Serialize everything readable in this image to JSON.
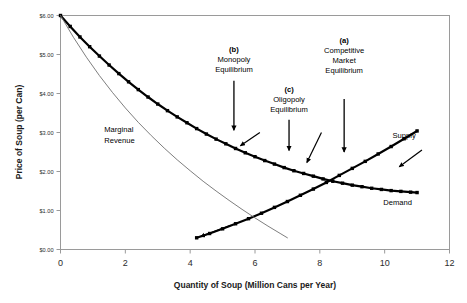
{
  "chart_data": {
    "type": "line",
    "title": "",
    "xlabel": "Quantity of Soup (Million Cans per Year)",
    "ylabel": "Price of Soup (per Can)",
    "xlim": [
      0,
      12
    ],
    "ylim": [
      0,
      6
    ],
    "xticks": [
      "0",
      "2",
      "4",
      "6",
      "8",
      "10",
      "12"
    ],
    "yticks": [
      "$0.00",
      "$1.00",
      "$2.00",
      "$3.00",
      "$4.00",
      "$5.00",
      "$6.00"
    ],
    "grid": false,
    "legend": "inline-labels",
    "series": [
      {
        "name": "Demand",
        "style": "thick-dotted-black",
        "label": "Demand",
        "label_x": 10.4,
        "label_y": 1.15,
        "points": [
          [
            0.0,
            6.0
          ],
          [
            0.3,
            5.72
          ],
          [
            0.6,
            5.45
          ],
          [
            0.9,
            5.2
          ],
          [
            1.2,
            4.96
          ],
          [
            1.5,
            4.73
          ],
          [
            1.8,
            4.51
          ],
          [
            2.1,
            4.3
          ],
          [
            2.4,
            4.1
          ],
          [
            2.7,
            3.91
          ],
          [
            3.0,
            3.73
          ],
          [
            3.3,
            3.56
          ],
          [
            3.6,
            3.4
          ],
          [
            3.9,
            3.25
          ],
          [
            4.2,
            3.1
          ],
          [
            4.5,
            2.96
          ],
          [
            4.8,
            2.83
          ],
          [
            5.1,
            2.71
          ],
          [
            5.4,
            2.59
          ],
          [
            5.7,
            2.48
          ],
          [
            6.0,
            2.38
          ],
          [
            6.3,
            2.28
          ],
          [
            6.6,
            2.19
          ],
          [
            6.9,
            2.1
          ],
          [
            7.2,
            2.02
          ],
          [
            7.5,
            1.95
          ],
          [
            7.8,
            1.88
          ],
          [
            8.1,
            1.81
          ],
          [
            8.4,
            1.75
          ],
          [
            8.7,
            1.7
          ],
          [
            9.0,
            1.65
          ],
          [
            9.3,
            1.61
          ],
          [
            9.6,
            1.57
          ],
          [
            9.9,
            1.54
          ],
          [
            10.2,
            1.51
          ],
          [
            10.5,
            1.49
          ],
          [
            10.8,
            1.47
          ],
          [
            11.0,
            1.46
          ]
        ]
      },
      {
        "name": "Supply",
        "style": "thick-dotted-black",
        "label": "Supply",
        "label_x": 10.6,
        "label_y": 2.85,
        "points": [
          [
            4.2,
            0.3
          ],
          [
            4.6,
            0.41
          ],
          [
            5.0,
            0.53
          ],
          [
            5.4,
            0.66
          ],
          [
            5.8,
            0.79
          ],
          [
            6.2,
            0.93
          ],
          [
            6.6,
            1.08
          ],
          [
            7.0,
            1.23
          ],
          [
            7.4,
            1.39
          ],
          [
            7.8,
            1.55
          ],
          [
            8.2,
            1.72
          ],
          [
            8.6,
            1.9
          ],
          [
            9.0,
            2.08
          ],
          [
            9.4,
            2.26
          ],
          [
            9.8,
            2.45
          ],
          [
            10.2,
            2.64
          ],
          [
            10.6,
            2.84
          ],
          [
            11.0,
            3.04
          ]
        ]
      },
      {
        "name": "Marginal Revenue",
        "style": "thin-solid-gray",
        "label": "Marginal Revenue",
        "label_x": 1.35,
        "label_y": 3.02,
        "points": [
          [
            0.0,
            6.0
          ],
          [
            0.4,
            5.44
          ],
          [
            0.8,
            4.93
          ],
          [
            1.2,
            4.46
          ],
          [
            1.6,
            4.03
          ],
          [
            2.0,
            3.63
          ],
          [
            2.4,
            3.26
          ],
          [
            2.8,
            2.92
          ],
          [
            3.2,
            2.6
          ],
          [
            3.6,
            2.3
          ],
          [
            4.0,
            2.02
          ],
          [
            4.4,
            1.75
          ],
          [
            4.8,
            1.5
          ],
          [
            5.2,
            1.26
          ],
          [
            5.6,
            1.03
          ],
          [
            6.0,
            0.81
          ],
          [
            6.4,
            0.6
          ],
          [
            6.8,
            0.4
          ],
          [
            7.0,
            0.3
          ]
        ]
      }
    ],
    "annotations": [
      {
        "id": "b",
        "tag": "(b)",
        "lines": [
          "Monopoly",
          "Equilibrium"
        ],
        "text_x": 5.35,
        "text_y": 5.06,
        "arrow_from": [
          5.35,
          4.33
        ],
        "arrow_to": [
          5.35,
          3.06
        ]
      },
      {
        "id": "c",
        "tag": "(c)",
        "lines": [
          "Oligopoly",
          "Equilibrium"
        ],
        "text_x": 7.05,
        "text_y": 4.05,
        "arrow_from": [
          7.05,
          3.33
        ],
        "arrow_to": [
          7.05,
          2.54
        ]
      },
      {
        "id": "a",
        "tag": "(a)",
        "lines": [
          "Competitive",
          "Market",
          "Equilibrium"
        ],
        "text_x": 8.75,
        "text_y": 5.3,
        "arrow_from": [
          8.75,
          3.86
        ],
        "arrow_to": [
          8.75,
          2.5
        ]
      }
    ],
    "pointer_arrows": [
      {
        "name": "monopoly-pointer",
        "from": [
          6.15,
          3.0
        ],
        "to": [
          5.55,
          2.66
        ]
      },
      {
        "name": "oligopoly-pointer",
        "from": [
          8.05,
          3.0
        ],
        "to": [
          7.6,
          2.23
        ]
      },
      {
        "name": "supply-pointer",
        "from": [
          5.25,
          0.62
        ],
        "to": [
          4.32,
          0.33
        ]
      },
      {
        "name": "supply-curve-pointer",
        "from": [
          11.15,
          2.55
        ],
        "to": [
          10.45,
          2.12
        ]
      }
    ]
  }
}
